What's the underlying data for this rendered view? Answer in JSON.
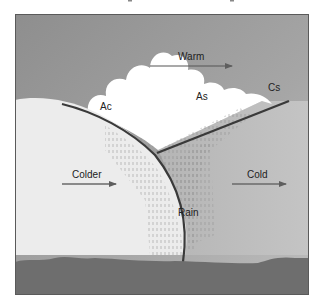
{
  "diagram": {
    "type": "warm-front-cross-section",
    "labels": {
      "warm": "Warm",
      "ac": "Ac",
      "as": "As",
      "cs": "Cs",
      "colder": "Colder",
      "cold": "Cold",
      "rain": "Rain"
    },
    "colors": {
      "sky": "#9a9a9a",
      "sky_light": "#b3b3b3",
      "cold_air_dome": "#e8e8e8",
      "cloud": "#ffffff",
      "front_line": "#3a3a3a",
      "ground": "#6e6e6e",
      "arrow": "#6a6a6a",
      "text": "#222222"
    },
    "arrows": [
      {
        "label": "Warm",
        "direction": "right"
      },
      {
        "label": "Colder",
        "direction": "right"
      },
      {
        "label": "Cold",
        "direction": "right"
      }
    ]
  }
}
